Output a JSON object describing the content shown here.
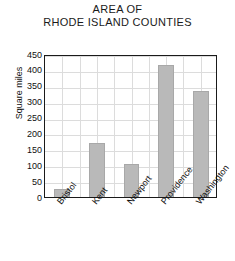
{
  "chart_data": {
    "type": "bar",
    "title": "AREA OF RHODE ISLAND COUNTIES",
    "title_lines": [
      "AREA OF",
      "RHODE ISLAND COUNTIES"
    ],
    "categories": [
      "Bristol",
      "Kent",
      "Newport",
      "Providence",
      "Washington"
    ],
    "values": [
      25,
      170,
      105,
      415,
      333
    ],
    "xlabel": "",
    "ylabel": "Square miles",
    "ylim": [
      0,
      450
    ],
    "ytick_step": 50,
    "yticks": [
      450,
      400,
      350,
      300,
      250,
      200,
      150,
      100,
      50,
      0
    ],
    "grid": true,
    "legend": false,
    "bar_color": "#b9b9b9",
    "axis_color": "#1a1a1a",
    "grid_color": "#dcdcdc",
    "background": "#ffffff"
  }
}
